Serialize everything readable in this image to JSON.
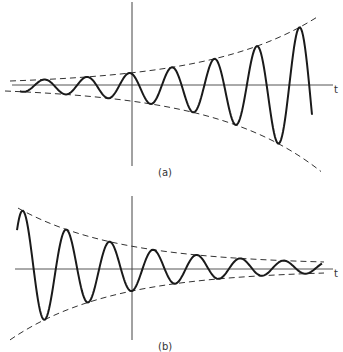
{
  "figure": {
    "panels": [
      {
        "id": "a",
        "label": "(a)",
        "axis_label": "t",
        "description": "Growing oscillation (exponentially increasing envelope)",
        "envelope": "increasing",
        "cycles": 8
      },
      {
        "id": "b",
        "label": "(b)",
        "axis_label": "t",
        "description": "Damped oscillation (exponentially decaying envelope)",
        "envelope": "decaying",
        "cycles": 7.5
      }
    ],
    "colors": {
      "curve": "#1a1a1a",
      "axis": "#444444",
      "envelope": "#333333"
    }
  }
}
